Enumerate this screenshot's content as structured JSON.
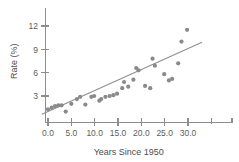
{
  "chart_data": {
    "type": "scatter",
    "title": "",
    "xlabel": "Years Since 1950",
    "ylabel": "Rate (%)",
    "xlim": [
      -1.5,
      34.0
    ],
    "ylim": [
      0.0,
      13.2
    ],
    "xticks": [
      0.0,
      5.0,
      10.0,
      15.0,
      20.0,
      25.0,
      30.0
    ],
    "xtick_labels": [
      "0.0",
      "5.0",
      "10.0",
      "15.0",
      "20.0",
      "25.0",
      "30.0"
    ],
    "yticks": [
      3,
      6,
      9,
      12
    ],
    "ytick_labels": [
      "3",
      "6",
      "9",
      "12"
    ],
    "grid": false,
    "legend": false,
    "marker_color": "#8a8a8a",
    "line_color": "#8f8f8f",
    "axis_color": "#8d8d8d",
    "text_color": "#5a5a5a",
    "series": [
      {
        "name": "Rate (%) vs Years Since 1950",
        "points": [
          [
            0.0,
            1.3
          ],
          [
            0.8,
            1.5
          ],
          [
            1.5,
            1.7
          ],
          [
            2.2,
            1.8
          ],
          [
            2.9,
            1.8
          ],
          [
            3.8,
            1.0
          ],
          [
            5.0,
            2.0
          ],
          [
            6.2,
            2.6
          ],
          [
            6.9,
            2.9
          ],
          [
            8.0,
            1.9
          ],
          [
            9.3,
            2.9
          ],
          [
            9.9,
            3.0
          ],
          [
            11.0,
            2.4
          ],
          [
            11.4,
            2.6
          ],
          [
            12.3,
            2.9
          ],
          [
            13.2,
            3.0
          ],
          [
            14.0,
            3.1
          ],
          [
            14.8,
            3.3
          ],
          [
            15.9,
            4.0
          ],
          [
            16.3,
            4.8
          ],
          [
            17.2,
            4.2
          ],
          [
            18.3,
            5.1
          ],
          [
            18.9,
            6.6
          ],
          [
            19.4,
            6.3
          ],
          [
            20.8,
            4.3
          ],
          [
            21.9,
            4.0
          ],
          [
            22.4,
            7.8
          ],
          [
            22.9,
            6.9
          ],
          [
            24.9,
            5.8
          ],
          [
            25.9,
            5.0
          ],
          [
            26.6,
            5.2
          ],
          [
            27.9,
            7.2
          ],
          [
            28.6,
            10.0
          ],
          [
            29.8,
            11.5
          ]
        ]
      }
    ],
    "fit_line": {
      "name": "least-squares regression line",
      "x0": -1.3,
      "y0": 0.65,
      "x1": 33.0,
      "y1": 9.9
    }
  }
}
